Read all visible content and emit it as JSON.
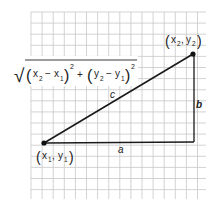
{
  "diagram": {
    "type": "distance-formula-right-triangle",
    "grid": {
      "left": 31,
      "top": 12,
      "right": 206,
      "bottom": 199,
      "cell": 11.1,
      "line_color": "#c8c8c8"
    },
    "points": {
      "p1": {
        "label_x": "x",
        "label_x_sub": "1",
        "label_y": "y",
        "label_y_sub": "1",
        "x": 44,
        "y": 143
      },
      "p2": {
        "label_x": "x",
        "label_x_sub": "2",
        "label_y": "y",
        "label_y_sub": "2",
        "x": 193,
        "y": 54
      },
      "corner": {
        "x": 194,
        "y": 142
      }
    },
    "sides": {
      "a": "a",
      "b": "b",
      "c": "c"
    },
    "formula": {
      "radical": "√",
      "term1_var": "x",
      "term1_sub_a": "2",
      "term1_minus": "−",
      "term1_var_b": "x",
      "term1_sub_b": "1",
      "term1_exp": "2",
      "plus": "+",
      "term2_var": "y",
      "term2_sub_a": "2",
      "term2_minus": "−",
      "term2_var_b": "y",
      "term2_sub_b": "1",
      "term2_exp": "2"
    },
    "colors": {
      "line": "#1a1a1a",
      "text": "#222222",
      "grid": "#c8c8c8"
    }
  }
}
